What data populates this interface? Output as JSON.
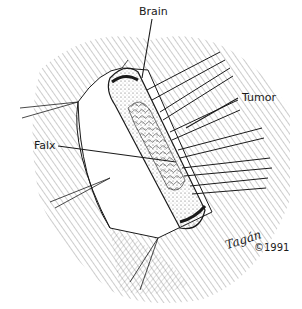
{
  "figure": {
    "colors": {
      "ink": "#1a1a1a",
      "background": "#ffffff"
    },
    "labels": [
      {
        "id": "brain",
        "text": "Brain"
      },
      {
        "id": "tumor",
        "text": "Tumor"
      },
      {
        "id": "falx",
        "text": "Falx"
      }
    ],
    "signature": {
      "artist": "Tagán",
      "copyright": "©1991"
    }
  }
}
